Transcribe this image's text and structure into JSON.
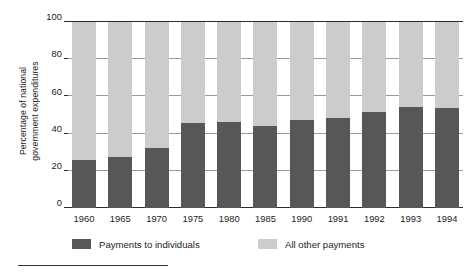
{
  "chart_data": {
    "type": "bar",
    "subtype": "stacked-bar-100",
    "title": "",
    "xlabel": "",
    "ylabel": "Percentage of national government expenditures",
    "ylabel_line1": "Percentage of national",
    "ylabel_line2": "government expenditures",
    "ylim": [
      0,
      100
    ],
    "yticks": [
      0,
      20,
      40,
      60,
      80,
      100
    ],
    "ytick_labels": [
      "0",
      "20",
      "40",
      "60",
      "80",
      "100"
    ],
    "grid": true,
    "legend_position": "bottom",
    "categories": [
      "1960",
      "1965",
      "1970",
      "1975",
      "1980",
      "1985",
      "1990",
      "1991",
      "1992",
      "1993",
      "1994"
    ],
    "series": [
      {
        "name": "Payments to individuals",
        "color": "#575758",
        "values": [
          26,
          27.5,
          32.5,
          45.5,
          46.5,
          44,
          47.5,
          48.5,
          51.5,
          54.5,
          54
        ]
      },
      {
        "name": "All other payments",
        "color": "#cccccc",
        "values": [
          74,
          72.5,
          67.5,
          54.5,
          53.5,
          56,
          52.5,
          51.5,
          48.5,
          45.5,
          46
        ]
      }
    ],
    "legend": [
      {
        "label": "Payments to individuals",
        "color": "#575758",
        "swatch": "dark-gray-swatch"
      },
      {
        "label": "All other payments",
        "color": "#cccccc",
        "swatch": "light-gray-swatch"
      }
    ],
    "colors": {
      "payments_to_individuals": "#575758",
      "all_other_payments": "#cccccc",
      "axis": "#2b2b2b",
      "gridline": "#9a9a9a",
      "background": "#ffffff",
      "text": "#1c1c1c"
    }
  }
}
